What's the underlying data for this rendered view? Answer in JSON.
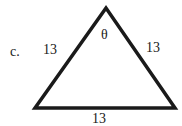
{
  "problem": {
    "label": "c.",
    "angle_symbol": "θ",
    "sides": {
      "left": "13",
      "right": "13",
      "bottom": "13"
    }
  },
  "colors": {
    "stroke": "#1a1a1a",
    "background": "#ffffff"
  }
}
